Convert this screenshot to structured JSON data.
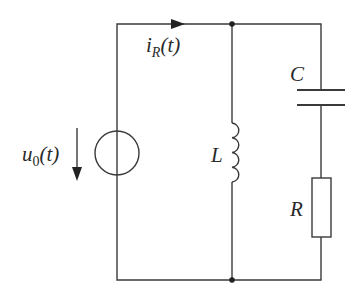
{
  "diagram": {
    "type": "circuit",
    "colors": {
      "stroke": "#3a3a3a",
      "text": "#2a2a2a",
      "background": "#ffffff"
    },
    "components": [
      {
        "id": "source",
        "kind": "voltage-source",
        "label_main": "u",
        "label_sub": "0",
        "label_arg": "(t)",
        "direction": "down"
      },
      {
        "id": "inductor",
        "kind": "inductor",
        "label": "L"
      },
      {
        "id": "capacitor",
        "kind": "capacitor",
        "label": "C"
      },
      {
        "id": "resistor",
        "kind": "resistor",
        "label": "R"
      }
    ],
    "current": {
      "label_main": "i",
      "label_sub": "R",
      "label_arg": "(t)",
      "direction": "right"
    },
    "labels": {
      "source_main": "u",
      "source_sub": "0",
      "source_arg": "(t)",
      "current_main": "i",
      "current_sub": "R",
      "current_arg": "(t)",
      "inductor": "L",
      "capacitor": "C",
      "resistor": "R"
    }
  }
}
